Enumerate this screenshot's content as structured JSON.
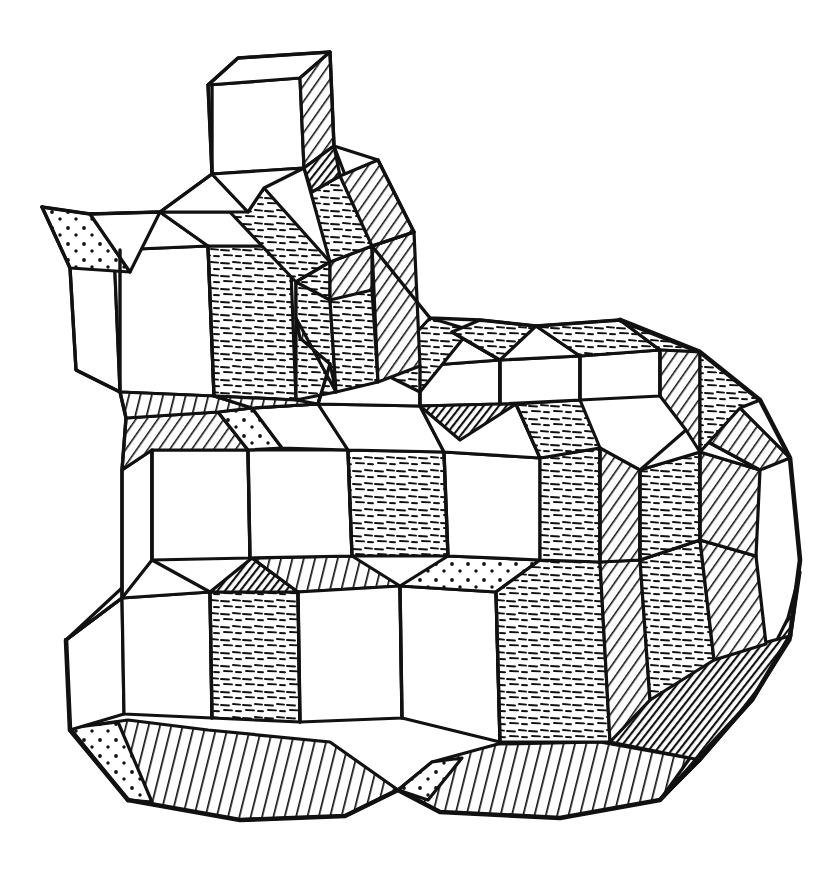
{
  "figure": {
    "medium": "pen-and-ink line drawing",
    "projection": "axonometric",
    "background_color": "#ffffff",
    "ink_color": "#111111",
    "canvas": {
      "width": 817,
      "height": 876
    },
    "caption": "",
    "labels": []
  },
  "legend": {
    "shading_styles": [
      {
        "key": "plain",
        "name": "unshaded top or left face",
        "description": "white, no texture"
      },
      {
        "key": "dash",
        "name": "dash-stipple front face",
        "description": "short horizontal dashes"
      },
      {
        "key": "hatch",
        "name": "diagonal hatch right face",
        "description": "parallel diagonal lines"
      },
      {
        "key": "vhatch",
        "name": "steep hatch underside",
        "description": "near-vertical parallel lines"
      },
      {
        "key": "dot",
        "name": "dotted sliver",
        "description": "sparse dots on thin wedge"
      },
      {
        "key": "dark",
        "name": "deep shadow",
        "description": "dense near-solid hatch"
      }
    ]
  },
  "geometry": {
    "block_count": 26,
    "outline": "M 82,205 L 210,60 L 313,60 L 333,120 L 420,228 L 420,300 L 500,318 L 560,330 L 640,325 L 700,355 L 755,425 L 790,500 L 800,560 L 790,640 L 760,720 L 690,790 L 600,812 L 520,800 L 455,812 L 380,818 L 300,822 L 230,818 L 140,800 L 72,735 L 62,640 L 70,560 L 122,455 L 120,300 Z",
    "blocks": [
      {
        "id": "B1",
        "name": "top-tower-cube",
        "ox": 210,
        "oy": 60,
        "w": 92,
        "h": 108,
        "d": 40,
        "top": "plain",
        "front": "plain",
        "right": "hatch"
      },
      {
        "id": "B2",
        "name": "tower-neck",
        "ox": 205,
        "oy": 168,
        "w": 100,
        "h": 60,
        "d": 42,
        "top": "plain",
        "front": "plain",
        "right": "dash"
      },
      {
        "id": "B3",
        "name": "upper-right-pillar",
        "ox": 300,
        "oy": 150,
        "w": 90,
        "h": 130,
        "d": 40,
        "top": "dash",
        "front": "dash",
        "right": "hatch"
      },
      {
        "id": "B4",
        "name": "left-shoulder-cube",
        "ox": 112,
        "oy": 215,
        "w": 95,
        "h": 120,
        "d": 45,
        "top": "plain",
        "front": "plain",
        "right": "plain"
      },
      {
        "id": "B5",
        "name": "left-spike-wedge",
        "ox": 42,
        "oy": 207,
        "w": 80,
        "h": 60,
        "d": 20,
        "top": "dot",
        "front": "plain",
        "right": "dot"
      },
      {
        "id": "B6",
        "name": "mid-left-cube",
        "ox": 200,
        "oy": 290,
        "w": 100,
        "h": 120,
        "d": 44,
        "top": "plain",
        "front": "dash",
        "right": "dash"
      },
      {
        "id": "B7",
        "name": "mid-ridge-bar",
        "ox": 235,
        "oy": 212,
        "w": 110,
        "h": 50,
        "d": 40,
        "top": "dash",
        "front": "dash",
        "right": "hatch"
      },
      {
        "id": "B8",
        "name": "center-top-cube",
        "ox": 385,
        "oy": 320,
        "w": 100,
        "h": 110,
        "d": 42,
        "top": "plain",
        "front": "plain",
        "right": "dash"
      },
      {
        "id": "B9",
        "name": "right-upper-cube",
        "ox": 490,
        "oy": 350,
        "w": 110,
        "h": 115,
        "d": 44,
        "top": "plain",
        "front": "dash",
        "right": "hatch"
      },
      {
        "id": "B10",
        "name": "far-right-cube",
        "ox": 600,
        "oy": 390,
        "w": 100,
        "h": 115,
        "d": 44,
        "top": "dash",
        "front": "dash",
        "right": "hatch"
      },
      {
        "id": "B11",
        "name": "center-plateau",
        "ox": 290,
        "oy": 370,
        "w": 110,
        "h": 110,
        "d": 42,
        "top": "plain",
        "front": "plain",
        "right": "dark"
      },
      {
        "id": "B12",
        "name": "left-mid-cube",
        "ox": 130,
        "oy": 460,
        "w": 110,
        "h": 115,
        "d": 44,
        "top": "hatch",
        "front": "plain",
        "right": "plain"
      },
      {
        "id": "B13",
        "name": "core-cube",
        "ox": 245,
        "oy": 465,
        "w": 110,
        "h": 115,
        "d": 42,
        "top": "dot",
        "front": "plain",
        "right": "plain"
      },
      {
        "id": "B14",
        "name": "core-right-cube",
        "ox": 360,
        "oy": 470,
        "w": 110,
        "h": 112,
        "d": 42,
        "top": "plain",
        "front": "dash",
        "right": "plain"
      },
      {
        "id": "B15",
        "name": "mid-right-cube",
        "ox": 470,
        "oy": 480,
        "w": 110,
        "h": 110,
        "d": 42,
        "top": "plain",
        "front": "plain",
        "right": "dash"
      },
      {
        "id": "B16",
        "name": "right-flank-cube",
        "ox": 580,
        "oy": 470,
        "w": 110,
        "h": 112,
        "d": 44,
        "top": "hatch",
        "front": "dash",
        "right": "hatch"
      },
      {
        "id": "B17",
        "name": "right-edge-cube",
        "ox": 690,
        "oy": 520,
        "w": 95,
        "h": 110,
        "d": 40,
        "top": "dash",
        "front": "dash",
        "right": "hatch"
      },
      {
        "id": "B18",
        "name": "lower-left-cube",
        "ox": 70,
        "oy": 600,
        "w": 105,
        "h": 115,
        "d": 44,
        "top": "plain",
        "front": "plain",
        "right": "plain"
      },
      {
        "id": "B19",
        "name": "lower-left-mid-cube",
        "ox": 175,
        "oy": 610,
        "w": 110,
        "h": 115,
        "d": 42,
        "top": "dark",
        "front": "dash",
        "right": "plain"
      },
      {
        "id": "B20",
        "name": "lower-center-cube",
        "ox": 290,
        "oy": 600,
        "w": 110,
        "h": 110,
        "d": 42,
        "top": "vhatch",
        "front": "plain",
        "right": "plain"
      },
      {
        "id": "B21",
        "name": "lower-center-right",
        "ox": 400,
        "oy": 600,
        "w": 105,
        "h": 108,
        "d": 42,
        "top": "vhatch",
        "front": "plain",
        "right": "plain"
      },
      {
        "id": "B22",
        "name": "lower-right-cube",
        "ox": 505,
        "oy": 620,
        "w": 110,
        "h": 112,
        "d": 42,
        "top": "dot",
        "front": "dash",
        "right": "hatch"
      },
      {
        "id": "B23",
        "name": "bottom-right-flank",
        "ox": 615,
        "oy": 640,
        "w": 100,
        "h": 105,
        "d": 42,
        "top": "hatch",
        "front": "dash",
        "right": "hatch"
      },
      {
        "id": "B24",
        "name": "base-left-skirt",
        "ox": 80,
        "oy": 718,
        "w": 200,
        "h": 70,
        "d": 40,
        "top": "vhatch",
        "front": "vhatch",
        "right": "vhatch"
      },
      {
        "id": "B25",
        "name": "base-center-skirt",
        "ox": 380,
        "oy": 740,
        "w": 230,
        "h": 70,
        "d": 40,
        "top": "vhatch",
        "front": "vhatch",
        "right": "vhatch"
      },
      {
        "id": "B26",
        "name": "base-right-shadow",
        "ox": 620,
        "oy": 700,
        "w": 150,
        "h": 100,
        "d": 40,
        "top": "dark",
        "front": "dark",
        "right": "dark"
      }
    ]
  }
}
